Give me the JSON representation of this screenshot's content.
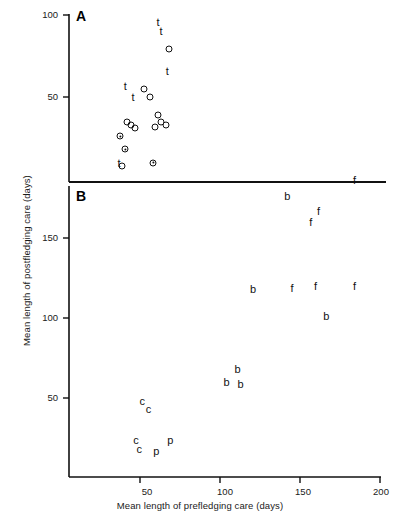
{
  "figure": {
    "xlabel": "Mean length of prefledging care (days)",
    "ylabel": "Mean length of postfledging care (days)",
    "panel_a_letter": "A",
    "panel_b_letter": "B"
  },
  "chart_data": {
    "type": "scatter",
    "title": "",
    "xlabel": "Mean length of prefledging care (days)",
    "ylabel": "Mean length of postfledging care (days)",
    "grid": false,
    "legend": "none",
    "panels": [
      {
        "id": "A",
        "label": "A",
        "xlim": [
          0,
          200
        ],
        "ylim": [
          0,
          100
        ],
        "yticks": [
          50,
          100
        ],
        "ytick_labels": [
          "50",
          "100"
        ],
        "xticks": [],
        "series": [
          {
            "name": "dagger-marker",
            "marker": "t",
            "marker_kind": "text",
            "points": [
              {
                "x": 57,
                "y": 96
              },
              {
                "x": 59,
                "y": 90
              },
              {
                "x": 63,
                "y": 66
              },
              {
                "x": 36,
                "y": 57
              },
              {
                "x": 41,
                "y": 50
              },
              {
                "x": 32,
                "y": 10
              }
            ]
          },
          {
            "name": "open-circle",
            "marker": "open-circle",
            "marker_kind": "circle",
            "points": [
              {
                "x": 64,
                "y": 79
              },
              {
                "x": 48,
                "y": 55
              },
              {
                "x": 52,
                "y": 50
              },
              {
                "x": 57,
                "y": 39
              },
              {
                "x": 59,
                "y": 35
              },
              {
                "x": 62,
                "y": 33
              },
              {
                "x": 55,
                "y": 32
              },
              {
                "x": 37,
                "y": 35
              },
              {
                "x": 40,
                "y": 33
              },
              {
                "x": 42,
                "y": 31
              },
              {
                "x": 34,
                "y": 8
              }
            ]
          },
          {
            "name": "dotted-circle",
            "marker": "dotted-circle",
            "marker_kind": "circle-dot",
            "points": [
              {
                "x": 33,
                "y": 26
              },
              {
                "x": 36,
                "y": 18
              },
              {
                "x": 54,
                "y": 10
              }
            ]
          }
        ]
      },
      {
        "id": "B",
        "label": "B",
        "xlim": [
          0,
          200
        ],
        "ylim": [
          0,
          190
        ],
        "yticks": [
          50,
          100,
          150
        ],
        "ytick_labels": [
          "50",
          "100",
          "150"
        ],
        "xticks": [
          50,
          100,
          150,
          200
        ],
        "xtick_labels": [
          "50",
          "100",
          "150",
          "200"
        ],
        "series": [
          {
            "name": "frigatebirds",
            "marker": "f",
            "marker_kind": "text",
            "points": [
              {
                "x": 183,
                "y": 186
              },
              {
                "x": 160,
                "y": 167
              },
              {
                "x": 155,
                "y": 160
              },
              {
                "x": 158,
                "y": 120
              },
              {
                "x": 183,
                "y": 120
              },
              {
                "x": 143,
                "y": 119
              }
            ]
          },
          {
            "name": "boobies",
            "marker": "b",
            "marker_kind": "text",
            "points": [
              {
                "x": 140,
                "y": 176
              },
              {
                "x": 118,
                "y": 118
              },
              {
                "x": 165,
                "y": 101
              },
              {
                "x": 108,
                "y": 68
              },
              {
                "x": 101,
                "y": 60
              },
              {
                "x": 110,
                "y": 59
              }
            ]
          },
          {
            "name": "cormorants",
            "marker": "c",
            "marker_kind": "text",
            "points": [
              {
                "x": 47,
                "y": 48
              },
              {
                "x": 51,
                "y": 43
              },
              {
                "x": 43,
                "y": 24
              },
              {
                "x": 45,
                "y": 18
              }
            ]
          },
          {
            "name": "pelicans",
            "marker": "p",
            "marker_kind": "text",
            "points": [
              {
                "x": 65,
                "y": 24
              },
              {
                "x": 56,
                "y": 17
              }
            ]
          }
        ]
      }
    ]
  }
}
